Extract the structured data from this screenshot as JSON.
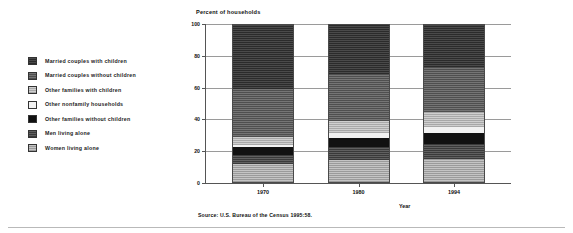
{
  "legend": {
    "items": [
      {
        "label": "Married couples with children",
        "key": "mcwc",
        "swatch": "dark-checkered-swatch"
      },
      {
        "label": "Married couples without children",
        "key": "mcwoc",
        "swatch": "medium-checkered-swatch"
      },
      {
        "label": "Other families with children",
        "key": "ofwc",
        "swatch": "light-checkered-swatch"
      },
      {
        "label": "Other nonfamily households",
        "key": "onfh",
        "swatch": "white-swatch"
      },
      {
        "label": "Other families without children",
        "key": "ofwoc",
        "swatch": "solid-black-swatch"
      },
      {
        "label": "Men living alone",
        "key": "mla",
        "swatch": "dark-gray-checkered-swatch"
      },
      {
        "label": "Women living alone",
        "key": "wla",
        "swatch": "light-gray-checkered-swatch"
      }
    ]
  },
  "axis": {
    "y_title": "Percent of households",
    "x_title": "Year",
    "y_ticks": [
      "0",
      "20",
      "40",
      "60",
      "80",
      "100"
    ],
    "x_ticks": [
      "1970",
      "1980",
      "1994"
    ]
  },
  "source": "Source: U.S. Bureau of the Census 1995:58.",
  "chart_data": {
    "type": "bar",
    "stacked": true,
    "title": "Percent of households",
    "xlabel": "Year",
    "ylabel": "Percent of households",
    "ylim": [
      0,
      100
    ],
    "grid": true,
    "legend_position": "left",
    "categories": [
      "1970",
      "1980",
      "1994"
    ],
    "series": [
      {
        "name": "Women living alone",
        "values": [
          11.5,
          14.0,
          14.5
        ],
        "color": "#adadad"
      },
      {
        "name": "Men living alone",
        "values": [
          5.5,
          8.5,
          10.0
        ],
        "color": "#4a4a4a"
      },
      {
        "name": "Other families without children",
        "values": [
          5.0,
          5.5,
          6.5
        ],
        "color": "#111111"
      },
      {
        "name": "Other nonfamily households",
        "values": [
          1.5,
          3.5,
          4.0
        ],
        "color": "#f2f2f2"
      },
      {
        "name": "Other families with children",
        "values": [
          5.0,
          7.5,
          9.5
        ],
        "color": "#bbbbbb"
      },
      {
        "name": "Married couples without children",
        "values": [
          30.5,
          29.5,
          29.0
        ],
        "color": "#5f5f5f"
      },
      {
        "name": "Married couples with children",
        "values": [
          41.0,
          31.5,
          26.5
        ],
        "color": "#333333"
      }
    ]
  }
}
